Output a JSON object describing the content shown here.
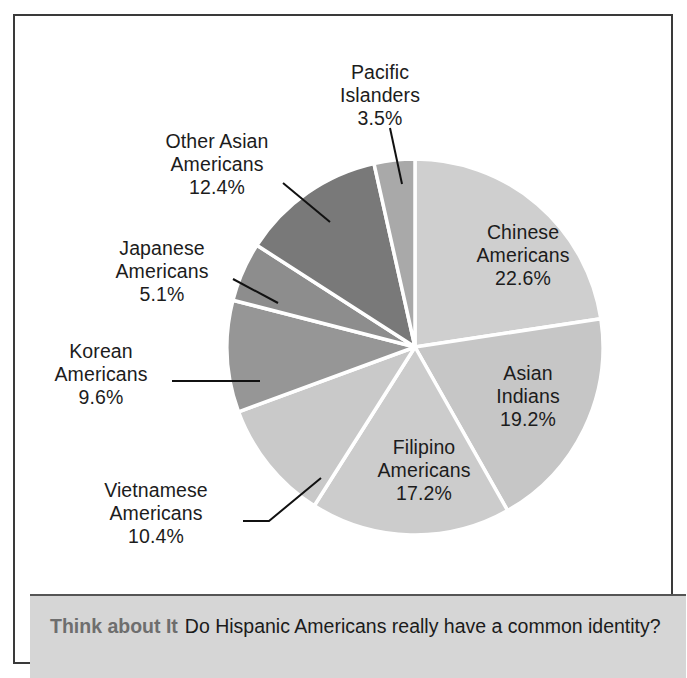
{
  "figure": {
    "background_color": "#ffffff",
    "border_color": "#3a3a3a"
  },
  "caption": {
    "lead": "Think about It",
    "text": "Do Hispanic Americans really have a common identity?",
    "band_color": "#d6d6d6",
    "lead_color": "#6e6e6e"
  },
  "chart_data": {
    "type": "pie",
    "title": "",
    "subtitle": "",
    "xlabel": "",
    "ylabel": "",
    "legend_position": "none",
    "grid": false,
    "units": "percent",
    "start_angle_deg": 0,
    "direction": "clockwise",
    "center": {
      "x": 385,
      "y": 315
    },
    "radius": 188,
    "separator_color": "#ffffff",
    "labels": [
      "Chinese Americans",
      "Asian Indians",
      "Filipino Americans",
      "Vietnamese Americans",
      "Korean Americans",
      "Japanese Americans",
      "Other Asian Americans",
      "Pacific Islanders"
    ],
    "values": [
      22.6,
      19.2,
      17.2,
      10.4,
      9.6,
      5.1,
      12.4,
      3.5
    ],
    "colors": [
      "#cfcfcf",
      "#c6c6c6",
      "#cccccc",
      "#c9c9c9",
      "#969696",
      "#8d8d8d",
      "#797979",
      "#a9a9a9"
    ],
    "slices": [
      {
        "name": "Chinese Americans",
        "label_line1": "Chinese",
        "label_line2": "Americans",
        "percent_text": "22.6%",
        "value": 22.6,
        "color": "#cfcfcf",
        "label_placement": "inside"
      },
      {
        "name": "Asian Indians",
        "label_line1": "Asian",
        "label_line2": "Indians",
        "percent_text": "19.2%",
        "value": 19.2,
        "color": "#c6c6c6",
        "label_placement": "inside"
      },
      {
        "name": "Filipino Americans",
        "label_line1": "Filipino",
        "label_line2": "Americans",
        "percent_text": "17.2%",
        "value": 17.2,
        "color": "#cccccc",
        "label_placement": "inside"
      },
      {
        "name": "Vietnamese Americans",
        "label_line1": "Vietnamese",
        "label_line2": "Americans",
        "percent_text": "10.4%",
        "value": 10.4,
        "color": "#c9c9c9",
        "label_placement": "outside-leader"
      },
      {
        "name": "Korean Americans",
        "label_line1": "Korean",
        "label_line2": "Americans",
        "percent_text": "9.6%",
        "value": 9.6,
        "color": "#969696",
        "label_placement": "outside-leader"
      },
      {
        "name": "Japanese Americans",
        "label_line1": "Japanese",
        "label_line2": "Americans",
        "percent_text": "5.1%",
        "value": 5.1,
        "color": "#8d8d8d",
        "label_placement": "outside-leader"
      },
      {
        "name": "Other Asian Americans",
        "label_line1": "Other Asian",
        "label_line2": "Americans",
        "percent_text": "12.4%",
        "value": 12.4,
        "color": "#797979",
        "label_placement": "outside-leader"
      },
      {
        "name": "Pacific Islanders",
        "label_line1": "Pacific",
        "label_line2": "Islanders",
        "percent_text": "3.5%",
        "value": 3.5,
        "color": "#a9a9a9",
        "label_placement": "outside-leader"
      }
    ]
  }
}
